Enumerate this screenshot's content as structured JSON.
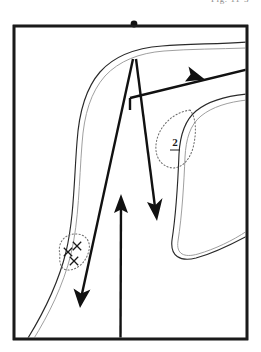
{
  "figure": {
    "top_caption": "Fig. 11-3",
    "frame": {
      "x": 14,
      "y": 26,
      "width": 233,
      "height": 313,
      "border_color": "#1a1a1a"
    },
    "station_dot": {
      "name": "station-dot",
      "cx": 134,
      "cy": 24,
      "r": 3.4,
      "color": "#111111"
    },
    "labels": [
      {
        "id": "region-2",
        "text": "2",
        "x": 175,
        "y": 146,
        "underlined": true
      }
    ],
    "cross_marks": [
      {
        "cx": 77,
        "cy": 246,
        "size": 4.2
      },
      {
        "cx": 68,
        "cy": 252,
        "size": 4.2
      },
      {
        "cx": 74,
        "cy": 261,
        "size": 4.2
      }
    ],
    "dotted_regions": [
      {
        "id": "dotted-region-left",
        "path": "M 60 255 C 57 243 64 235 74 234 C 85 233 91 241 89 250 C 87 261 78 270 68 270 C 61 270 59 263 60 255 Z"
      },
      {
        "id": "dotted-region-2",
        "path": "M 190 110 C 176 112 163 122 158 136 C 153 150 157 163 168 167 C 179 171 189 162 193 148 C 197 132 196 117 190 110 Z"
      }
    ],
    "rivers": [
      {
        "id": "river-north-west",
        "dark": "M 28 338 C 44 312 58 284 66 252 C 74 218 74 180 77 142 C 79 112 86 88 100 72 C 114 56 136 48 162 46 C 188 44 216 44 247 42",
        "light": "M 33 340 C 49 314 63 286 71 254 C 79 220 79 182 82 144 C 84 114 91 92 105 76 C 119 61 139 53 164 51 C 190 49 218 49 247 48"
      },
      {
        "id": "river-east-bend",
        "dark": "M 247 94 C 226 96 208 101 196 111 C 184 121 180 136 179 154 C 178 180 176 214 172 240 C 170 256 180 262 196 258 C 214 253 232 244 247 236",
        "light": "M 247 100 C 228 102 212 107 201 116 C 190 125 186 139 185 157 C 184 182 182 216 178 241 C 176 254 184 258 198 254 C 215 249 232 241 247 231"
      }
    ],
    "arrows": [
      {
        "id": "arrow-down-left",
        "description": "long arrow from apex down to lower left",
        "x1": 133,
        "y1": 59,
        "x2": 80,
        "y2": 303,
        "head_angle_deg": 258
      },
      {
        "id": "arrow-down-center",
        "description": "arrow from apex down to center",
        "x1": 136,
        "y1": 59,
        "x2": 156,
        "y2": 214,
        "head_angle_deg": 83
      },
      {
        "id": "arrow-up-center",
        "description": "arrow from bottom border upward",
        "x1": 120,
        "y1": 339,
        "x2": 121,
        "y2": 196,
        "head_angle_deg": 270
      },
      {
        "id": "arrow-right-up",
        "description": "arrow from center going right and slightly up past frame",
        "x1": 130,
        "y1": 98,
        "x2": 259,
        "y2": 66,
        "head_angle_deg": 346
      }
    ]
  }
}
